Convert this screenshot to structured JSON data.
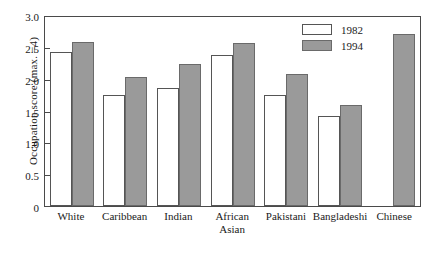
{
  "chart_data": {
    "type": "bar",
    "title": "",
    "xlabel": "",
    "ylabel": "Occupation score (max. =4)",
    "ylim": [
      0,
      3.0
    ],
    "yticks": [
      "0",
      "0.5",
      "1.0",
      "1.5",
      "2.0",
      "2.5",
      "3.0"
    ],
    "grid": false,
    "legend_position": "top-right",
    "categories": [
      "White",
      "Caribbean",
      "Indian",
      "African Asian",
      "Pakistani",
      "Bangladeshi",
      "Chinese"
    ],
    "category_lines": [
      [
        "White"
      ],
      [
        "Caribbean"
      ],
      [
        "Indian"
      ],
      [
        "African",
        "Asian"
      ],
      [
        "Pakistani"
      ],
      [
        "Bangladeshi"
      ],
      [
        "Chinese"
      ]
    ],
    "series": [
      {
        "name": "1982",
        "color": "#ffffff",
        "values": [
          2.42,
          1.74,
          1.86,
          2.37,
          1.74,
          1.42,
          null
        ]
      },
      {
        "name": "1994",
        "color": "#9a9a9a",
        "values": [
          2.58,
          2.02,
          2.23,
          2.56,
          2.08,
          1.59,
          2.7
        ]
      }
    ]
  },
  "legend": {
    "items": [
      {
        "label": "1982"
      },
      {
        "label": "1994"
      }
    ]
  }
}
